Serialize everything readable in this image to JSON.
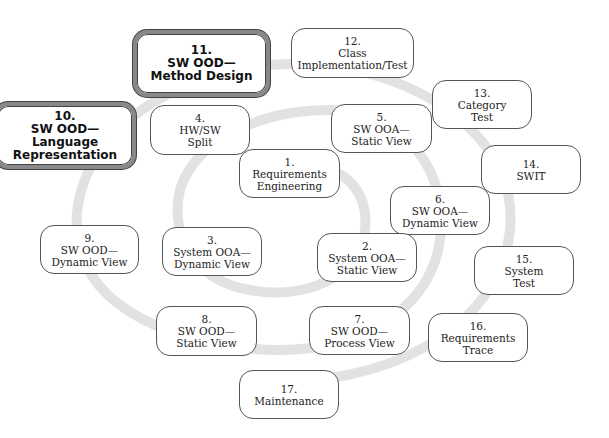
{
  "diagram": {
    "type": "spiral process diagram",
    "spiral_color": "#e2e2e2",
    "highlight_border_color": "#888888",
    "nodes": [
      {
        "id": "1",
        "num": "1.",
        "line1": "Requirements",
        "line2": "Engineering",
        "highlighted": false
      },
      {
        "id": "2",
        "num": "2.",
        "line1": "System OOA—",
        "line2": "Static View",
        "highlighted": false
      },
      {
        "id": "3",
        "num": "3.",
        "line1": "System OOA—",
        "line2": "Dynamic View",
        "highlighted": false
      },
      {
        "id": "4",
        "num": "4.",
        "line1": "HW/SW",
        "line2": "Split",
        "highlighted": false
      },
      {
        "id": "5",
        "num": "5.",
        "line1": "SW OOA—",
        "line2": "Static View",
        "highlighted": false
      },
      {
        "id": "6",
        "num": "6.",
        "line1": "SW OOA—",
        "line2": "Dynamic View",
        "highlighted": false
      },
      {
        "id": "7",
        "num": "7.",
        "line1": "SW OOD—",
        "line2": "Process View",
        "highlighted": false
      },
      {
        "id": "8",
        "num": "8.",
        "line1": "SW OOD—",
        "line2": "Static View",
        "highlighted": false
      },
      {
        "id": "9",
        "num": "9.",
        "line1": "SW OOD—",
        "line2": "Dynamic View",
        "highlighted": false
      },
      {
        "id": "10",
        "num": "10.",
        "line1": "SW OOD—",
        "line2": "Language",
        "line3": "Representation",
        "highlighted": true
      },
      {
        "id": "11",
        "num": "11.",
        "line1": "SW OOD—",
        "line2": "Method Design",
        "highlighted": true
      },
      {
        "id": "12",
        "num": "12.",
        "line1": "Class",
        "line2": "Implementation/Test",
        "highlighted": false
      },
      {
        "id": "13",
        "num": "13.",
        "line1": "Category",
        "line2": "Test",
        "highlighted": false
      },
      {
        "id": "14",
        "num": "14.",
        "line1": "SWIT",
        "highlighted": false
      },
      {
        "id": "15",
        "num": "15.",
        "line1": "System",
        "line2": "Test",
        "highlighted": false
      },
      {
        "id": "16",
        "num": "16.",
        "line1": "Requirements",
        "line2": "Trace",
        "highlighted": false
      },
      {
        "id": "17",
        "num": "17.",
        "line1": "Maintenance",
        "highlighted": false
      }
    ]
  }
}
